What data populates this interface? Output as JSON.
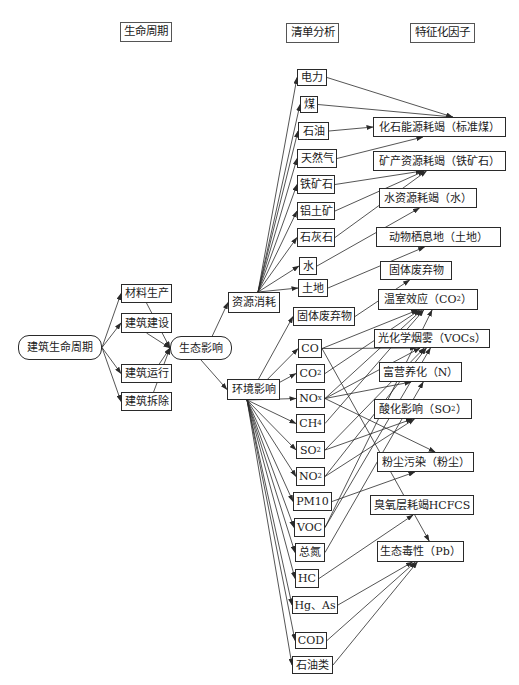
{
  "headers": [
    {
      "id": "h1",
      "label": "生命周期",
      "x": 120,
      "y": 22,
      "w": 52,
      "h": 20
    },
    {
      "id": "h2",
      "label": "清单分析",
      "x": 286,
      "y": 23,
      "w": 53,
      "h": 20
    },
    {
      "id": "h3",
      "label": "特征化因子",
      "x": 410,
      "y": 23,
      "w": 65,
      "h": 20
    }
  ],
  "lifecycle": {
    "root": {
      "id": "root",
      "label": "建筑生命周期",
      "x": 18,
      "y": 335,
      "w": 84,
      "h": 25
    },
    "stages": [
      {
        "id": "s1",
        "label": "材料生产",
        "x": 121,
        "y": 284,
        "w": 51,
        "h": 19
      },
      {
        "id": "s2",
        "label": "建筑建设",
        "x": 121,
        "y": 313,
        "w": 51,
        "h": 20
      },
      {
        "id": "s3",
        "label": "建筑运行",
        "x": 121,
        "y": 364,
        "w": 51,
        "h": 19
      },
      {
        "id": "s4",
        "label": "建筑拆除",
        "x": 121,
        "y": 392,
        "w": 51,
        "h": 19
      }
    ],
    "impact": {
      "id": "eco",
      "label": "生态影响",
      "x": 170,
      "y": 336,
      "w": 62,
      "h": 24
    }
  },
  "categories": [
    {
      "id": "res",
      "label": "资源消耗",
      "x": 228,
      "y": 292,
      "w": 52,
      "h": 21
    },
    {
      "id": "env",
      "label": "环境影响",
      "x": 227,
      "y": 379,
      "w": 53,
      "h": 21
    }
  ],
  "inventory": {
    "resources": [
      {
        "id": "r1",
        "label": "电力",
        "x": 297,
        "y": 69,
        "w": 30,
        "h": 17
      },
      {
        "id": "r2",
        "label": "煤",
        "x": 300,
        "y": 96,
        "w": 18,
        "h": 17
      },
      {
        "id": "r3",
        "label": "石油",
        "x": 298,
        "y": 122,
        "w": 31,
        "h": 18
      },
      {
        "id": "r4",
        "label": "天然气",
        "x": 297,
        "y": 149,
        "w": 40,
        "h": 19
      },
      {
        "id": "r5",
        "label": "铁矿石",
        "x": 297,
        "y": 175,
        "w": 38,
        "h": 19
      },
      {
        "id": "r6",
        "label": "铝土矿",
        "x": 297,
        "y": 202,
        "w": 38,
        "h": 18
      },
      {
        "id": "r7",
        "label": "石灰石",
        "x": 297,
        "y": 228,
        "w": 38,
        "h": 19
      },
      {
        "id": "r8",
        "label": "水",
        "x": 299,
        "y": 257,
        "w": 18,
        "h": 18
      },
      {
        "id": "r9",
        "label": "土地",
        "x": 298,
        "y": 279,
        "w": 30,
        "h": 18
      }
    ],
    "emissions": [
      {
        "id": "e1",
        "label": "固体废弃物",
        "x": 293,
        "y": 307,
        "w": 62,
        "h": 19
      },
      {
        "id": "e2",
        "label": "CO",
        "x": 298,
        "y": 339,
        "w": 24,
        "h": 19
      },
      {
        "id": "e3",
        "label": "CO",
        "sub": "2",
        "x": 296,
        "y": 364,
        "w": 29,
        "h": 19
      },
      {
        "id": "e4",
        "label": "NO",
        "sub": "x",
        "x": 296,
        "y": 389,
        "w": 29,
        "h": 19
      },
      {
        "id": "e5",
        "label": "CH",
        "sub": "4",
        "x": 296,
        "y": 414,
        "w": 29,
        "h": 19
      },
      {
        "id": "e6",
        "label": "SO",
        "sub": "2",
        "x": 296,
        "y": 441,
        "w": 29,
        "h": 18
      },
      {
        "id": "e7",
        "label": "NO",
        "sub": "2",
        "x": 296,
        "y": 467,
        "w": 29,
        "h": 19
      },
      {
        "id": "e8",
        "label": "PM10",
        "x": 293,
        "y": 492,
        "w": 39,
        "h": 19
      },
      {
        "id": "e9",
        "label": "VOC",
        "x": 294,
        "y": 518,
        "w": 31,
        "h": 19
      },
      {
        "id": "e10",
        "label": "总氮",
        "x": 295,
        "y": 543,
        "w": 30,
        "h": 19
      },
      {
        "id": "e11",
        "label": "HC",
        "x": 295,
        "y": 569,
        "w": 24,
        "h": 19
      },
      {
        "id": "e12",
        "label": "Hg、As",
        "x": 292,
        "y": 596,
        "w": 46,
        "h": 18
      },
      {
        "id": "e13",
        "label": "COD",
        "x": 295,
        "y": 632,
        "w": 32,
        "h": 17
      },
      {
        "id": "e14",
        "label": "石油类",
        "x": 292,
        "y": 656,
        "w": 41,
        "h": 18
      }
    ]
  },
  "factors": [
    {
      "id": "f1",
      "label": "化石能源耗竭（标准煤）",
      "x": 373,
      "y": 117,
      "w": 133,
      "h": 20
    },
    {
      "id": "f2",
      "label": "矿产资源耗竭（铁矿石）",
      "x": 373,
      "y": 151,
      "w": 133,
      "h": 20
    },
    {
      "id": "f3",
      "label": "水资源耗竭（水）",
      "x": 379,
      "y": 188,
      "w": 98,
      "h": 20
    },
    {
      "id": "f4",
      "label": "动物栖息地（土地）",
      "x": 376,
      "y": 227,
      "w": 125,
      "h": 20
    },
    {
      "id": "f5",
      "label": "固体废弃物",
      "x": 380,
      "y": 261,
      "w": 72,
      "h": 19
    },
    {
      "id": "f6",
      "label": "温室效应（CO",
      "sub": "2",
      "tail": "）",
      "x": 378,
      "y": 289,
      "w": 100,
      "h": 21
    },
    {
      "id": "f7",
      "label": "光化学烟雾（VOCs）",
      "x": 374,
      "y": 329,
      "w": 116,
      "h": 19
    },
    {
      "id": "f8",
      "label": "富营养化（N）",
      "x": 379,
      "y": 362,
      "w": 83,
      "h": 20
    },
    {
      "id": "f9",
      "label": "酸化影响（SO",
      "sub": "2",
      "tail": "）",
      "x": 374,
      "y": 399,
      "w": 98,
      "h": 20
    },
    {
      "id": "f10",
      "label": "粉尘污染（粉尘）",
      "x": 377,
      "y": 452,
      "w": 97,
      "h": 20
    },
    {
      "id": "f11",
      "label": "臭氧层耗竭HCFCS",
      "x": 370,
      "y": 495,
      "w": 104,
      "h": 20
    },
    {
      "id": "f12",
      "label": "生态毒性（Pb）",
      "x": 377,
      "y": 541,
      "w": 87,
      "h": 21
    }
  ],
  "edges": [
    [
      "root",
      "s1"
    ],
    [
      "root",
      "s2"
    ],
    [
      "root",
      "s3"
    ],
    [
      "root",
      "s4"
    ],
    [
      "s1",
      "eco"
    ],
    [
      "s2",
      "eco"
    ],
    [
      "s3",
      "eco"
    ],
    [
      "s4",
      "eco"
    ],
    [
      "eco",
      "res"
    ],
    [
      "eco",
      "env"
    ],
    [
      "res",
      "r1"
    ],
    [
      "res",
      "r2"
    ],
    [
      "res",
      "r3"
    ],
    [
      "res",
      "r4"
    ],
    [
      "res",
      "r5"
    ],
    [
      "res",
      "r6"
    ],
    [
      "res",
      "r7"
    ],
    [
      "res",
      "r8"
    ],
    [
      "res",
      "r9"
    ],
    [
      "env",
      "e1"
    ],
    [
      "env",
      "e2"
    ],
    [
      "env",
      "e3"
    ],
    [
      "env",
      "e4"
    ],
    [
      "env",
      "e5"
    ],
    [
      "env",
      "e6"
    ],
    [
      "env",
      "e7"
    ],
    [
      "env",
      "e8"
    ],
    [
      "env",
      "e9"
    ],
    [
      "env",
      "e10"
    ],
    [
      "env",
      "e11"
    ],
    [
      "env",
      "e12"
    ],
    [
      "env",
      "e13"
    ],
    [
      "env",
      "e14"
    ],
    [
      "r1",
      "f1"
    ],
    [
      "r2",
      "f1"
    ],
    [
      "r3",
      "f1"
    ],
    [
      "r4",
      "f1"
    ],
    [
      "r5",
      "f2"
    ],
    [
      "r6",
      "f2"
    ],
    [
      "r7",
      "f2"
    ],
    [
      "r8",
      "f3"
    ],
    [
      "r9",
      "f4"
    ],
    [
      "e1",
      "f5"
    ],
    [
      "e2",
      "f6"
    ],
    [
      "e3",
      "f6"
    ],
    [
      "e4",
      "f6"
    ],
    [
      "e5",
      "f6"
    ],
    [
      "e9",
      "f6"
    ],
    [
      "e2",
      "f7"
    ],
    [
      "e4",
      "f7"
    ],
    [
      "e6",
      "f7"
    ],
    [
      "e7",
      "f7"
    ],
    [
      "e9",
      "f7"
    ],
    [
      "e4",
      "f8"
    ],
    [
      "e10",
      "f8"
    ],
    [
      "e6",
      "f9"
    ],
    [
      "e7",
      "f9"
    ],
    [
      "e4",
      "f10"
    ],
    [
      "e8",
      "f10"
    ],
    [
      "e11",
      "f11"
    ],
    [
      "e2",
      "f12"
    ],
    [
      "e12",
      "f12"
    ],
    [
      "e13",
      "f12"
    ],
    [
      "e14",
      "f12"
    ]
  ],
  "style": {
    "line_color": "#2a2a2a",
    "box_border": "#2a2a2a",
    "background": "#ffffff"
  }
}
